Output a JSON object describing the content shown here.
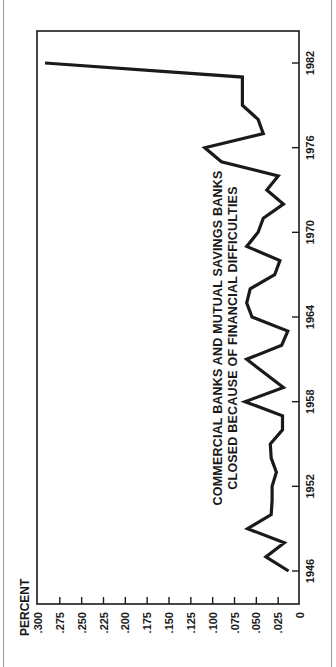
{
  "chart_data": {
    "type": "line",
    "orientation": "rotated-90-ccw",
    "title": "",
    "annotation": [
      "COMMERCIAL BANKS AND MUTUAL SAVINGS BANKS",
      "CLOSED BECAUSE OF FINANCIAL DIFFICULTIES"
    ],
    "xlabel": "",
    "ylabel": "PERCENT",
    "x_ticks": [
      "1946",
      "1952",
      "1958",
      "1964",
      "1970",
      "1976",
      "1982"
    ],
    "y_ticks": [
      "0",
      ".025",
      ".050",
      ".075",
      ".100",
      ".125",
      ".150",
      ".175",
      ".200",
      ".225",
      ".250",
      ".275",
      ".300"
    ],
    "xlim": [
      1946,
      1982
    ],
    "ylim": [
      0,
      0.3
    ],
    "grid": false,
    "legend": null,
    "x": [
      1946,
      1947,
      1948,
      1949,
      1950,
      1951,
      1952,
      1953,
      1954,
      1955,
      1956,
      1957,
      1958,
      1959,
      1960,
      1961,
      1962,
      1963,
      1964,
      1965,
      1966,
      1967,
      1968,
      1969,
      1970,
      1971,
      1972,
      1973,
      1974,
      1975,
      1976,
      1977,
      1978,
      1979,
      1980,
      1981,
      1982
    ],
    "series": [
      {
        "name": "Banks closed (percent)",
        "values": [
          0.013,
          0.039,
          0.018,
          0.06,
          0.033,
          0.032,
          0.032,
          0.027,
          0.033,
          0.034,
          0.02,
          0.02,
          0.063,
          0.019,
          0.04,
          0.061,
          0.021,
          0.014,
          0.055,
          0.061,
          0.057,
          0.029,
          0.023,
          0.061,
          0.048,
          0.042,
          0.019,
          0.038,
          0.025,
          0.09,
          0.109,
          0.042,
          0.048,
          0.066,
          0.066,
          0.066,
          0.292
        ]
      }
    ]
  },
  "layout": {
    "frame": {
      "left": 37,
      "top": 31,
      "right": 299,
      "bottom": 604
    },
    "percent_axis": {
      "x_at_zero": 300,
      "x_at_max": 38
    },
    "year_axis": {
      "y_at_start": 571,
      "y_at_end": 63
    },
    "line_color": "#1a1a1a",
    "axis_color": "#1a1a1a"
  }
}
